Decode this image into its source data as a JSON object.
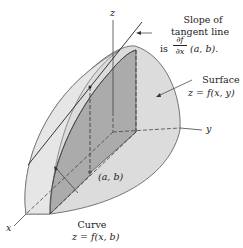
{
  "diagram": {
    "title": "",
    "axes": {
      "x": "x",
      "y": "y",
      "z": "z"
    },
    "labels": {
      "slope_line1": "Slope of",
      "slope_line2": "tangent line",
      "slope_prefix": "is",
      "slope_frac_num": "∂f",
      "slope_frac_den": "∂x",
      "slope_suffix": "(a, b).",
      "surface_line1": "Surface",
      "surface_line2": "z = f(x, y)",
      "point": "(a, b)",
      "curve_line1": "Curve",
      "curve_line2": "z = f(x, b)"
    },
    "colors": {
      "surface_fill": "#d9d9d9",
      "plane_fill": "#a9a9a9",
      "outline": "#555555",
      "background": "#ffffff"
    }
  }
}
